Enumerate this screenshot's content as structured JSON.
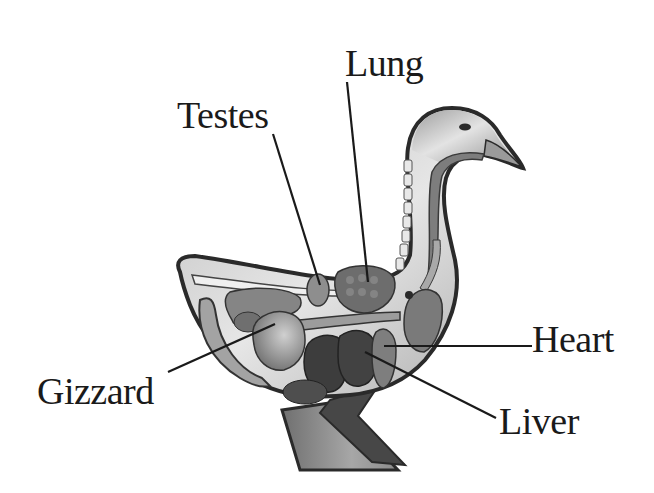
{
  "diagram": {
    "labels": [
      {
        "id": "lung",
        "text": "Lung",
        "x": 345,
        "y": 44,
        "points_to": "lung"
      },
      {
        "id": "testes",
        "text": "Testes",
        "x": 177,
        "y": 96,
        "points_to": "testes"
      },
      {
        "id": "heart",
        "text": "Heart",
        "x": 532,
        "y": 320,
        "points_to": "heart"
      },
      {
        "id": "gizzard",
        "text": "Gizzard",
        "x": 37,
        "y": 372,
        "points_to": "gizzard"
      },
      {
        "id": "liver",
        "text": "Liver",
        "x": 499,
        "y": 402,
        "points_to": "liver"
      }
    ],
    "leader_lines": [
      {
        "label": "lung",
        "from": [
          347,
          82
        ],
        "to": [
          368,
          282
        ]
      },
      {
        "label": "testes",
        "from": [
          273,
          134
        ],
        "to": [
          320,
          285
        ]
      },
      {
        "label": "heart",
        "from": [
          532,
          346
        ],
        "to": [
          384,
          346
        ]
      },
      {
        "label": "gizzard",
        "from": [
          168,
          372
        ],
        "to": [
          275,
          324
        ]
      },
      {
        "label": "liver",
        "from": [
          496,
          418
        ],
        "to": [
          365,
          352
        ]
      }
    ],
    "colors": {
      "background": "#ffffff",
      "outline": "#2a2a2a",
      "body_fill": "#c9c9c9",
      "body_inner": "#e9e9e9",
      "organ_dark": "#3d3d3d",
      "organ_mid": "#6e6e6e",
      "organ_light": "#9a9a9a",
      "leg_dark": "#474747",
      "leg_light": "#8f8f8f",
      "text": "#1a1a1a"
    }
  }
}
